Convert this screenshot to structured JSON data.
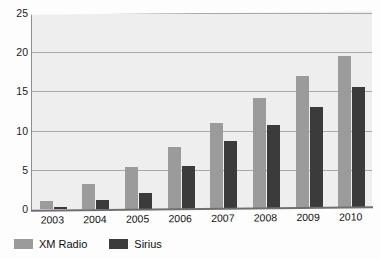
{
  "chart_data": {
    "type": "bar",
    "title": "",
    "xlabel": "",
    "ylabel": "",
    "ylim": [
      0,
      25
    ],
    "yticks": [
      0,
      5,
      10,
      15,
      20,
      25
    ],
    "grid": true,
    "legend_position": "bottom-left",
    "categories": [
      "2003",
      "2004",
      "2005",
      "2006",
      "2007",
      "2008",
      "2009",
      "2010"
    ],
    "series": [
      {
        "name": "XM Radio",
        "color": "#9b9b9b",
        "values": [
          1.0,
          3.2,
          5.3,
          7.9,
          11.0,
          14.1,
          17.0,
          19.5
        ]
      },
      {
        "name": "Sirius",
        "color": "#3b3b3b",
        "values": [
          0.3,
          1.1,
          2.1,
          5.5,
          8.7,
          10.7,
          13.0,
          15.5
        ]
      }
    ]
  },
  "legend": {
    "items": [
      {
        "label": "XM Radio",
        "color": "#9b9b9b"
      },
      {
        "label": "Sirius",
        "color": "#3b3b3b"
      }
    ]
  },
  "axis": {
    "y_tick_labels": [
      "25",
      "20",
      "15",
      "10",
      "5",
      "0"
    ]
  }
}
